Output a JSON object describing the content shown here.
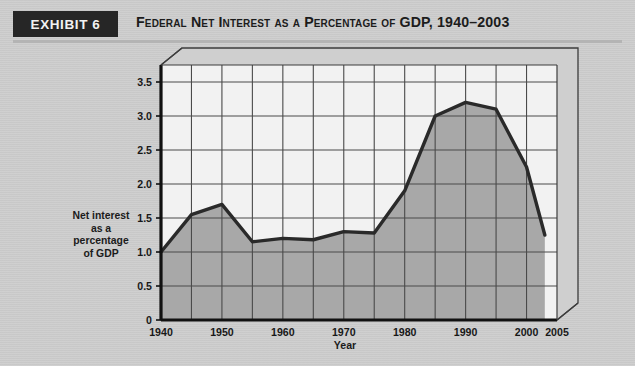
{
  "header": {
    "exhibit_label": "EXHIBIT 6",
    "title": "Federal Net Interest as a Percentage of GDP, 1940–2003",
    "band_color": "#262626"
  },
  "colors": {
    "page_background": "#cdcdcd",
    "plot_background": "#f2f2f2",
    "area_fill": "#a8a8a8",
    "line": "#2a2a2a",
    "grid": "#4a4a4a",
    "axis": "#111111"
  },
  "chart_data": {
    "type": "area",
    "title": "Federal Net Interest as a Percentage of GDP, 1940–2003",
    "xlabel": "Year",
    "ylabel": "Net interest as a percentage of GDP",
    "ylabel_lines": [
      "Net interest",
      "as a",
      "percentage",
      "of GDP"
    ],
    "xlim": [
      1940,
      2005
    ],
    "ylim": [
      0,
      3.75
    ],
    "xticks": [
      1940,
      1950,
      1960,
      1970,
      1980,
      1990,
      2000,
      2005
    ],
    "xtick_labels": [
      "1940",
      "1950",
      "1960",
      "1970",
      "1980",
      "1990",
      "2000",
      "2005"
    ],
    "yticks": [
      0,
      0.5,
      1.0,
      1.5,
      2.0,
      2.5,
      3.0,
      3.5
    ],
    "ytick_labels": [
      "0",
      "0.5",
      "1.0",
      "1.5",
      "2.0",
      "2.5",
      "3.0",
      "3.5"
    ],
    "grid": true,
    "x_gridline_step": 5,
    "y_gridline_step": 0.5,
    "legend": null,
    "x": [
      1940,
      1945,
      1950,
      1955,
      1960,
      1965,
      1970,
      1975,
      1980,
      1985,
      1990,
      1995,
      2000,
      2003
    ],
    "values": [
      1.0,
      1.55,
      1.7,
      1.15,
      1.2,
      1.18,
      1.3,
      1.28,
      1.9,
      3.0,
      3.2,
      3.1,
      2.25,
      1.25
    ],
    "series": [
      {
        "name": "Net interest as a percentage of GDP",
        "values": [
          1.0,
          1.55,
          1.7,
          1.15,
          1.2,
          1.18,
          1.3,
          1.28,
          1.9,
          3.0,
          3.2,
          3.1,
          2.25,
          1.25
        ]
      }
    ]
  }
}
